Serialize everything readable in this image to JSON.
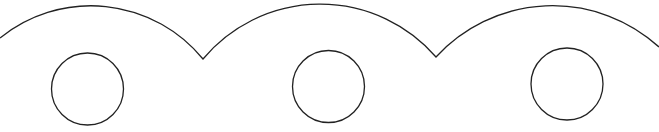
{
  "diagram": {
    "width": 659,
    "height": 132,
    "background": "#ffffff",
    "stroke_color": "#222222",
    "stroke_width": 1.3,
    "scallop_path": "M 0 38 A 144.5 144.5 0 0 1 203 59 A 153 153 0 0 1 436 57 A 158 158 0 0 1 659 47",
    "circles": [
      {
        "cx": 87.5,
        "cy": 89,
        "r": 36
      },
      {
        "cx": 328.5,
        "cy": 86.5,
        "r": 36
      },
      {
        "cx": 567,
        "cy": 84,
        "r": 36
      }
    ]
  }
}
